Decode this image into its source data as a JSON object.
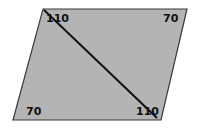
{
  "diagram": {
    "shape": "parallelogram",
    "fill": "#b4b4b4",
    "stroke": "#3a3a3a",
    "diagonal_color": "#111111",
    "angles": {
      "top_left": "110",
      "top_right": "70",
      "bottom_left": "70",
      "bottom_right": "110"
    }
  }
}
